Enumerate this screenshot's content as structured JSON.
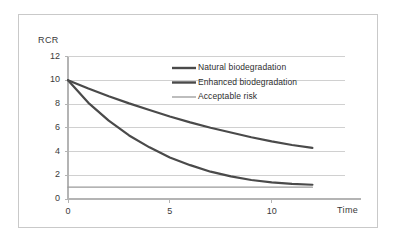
{
  "figure": {
    "background_color": "#ffffff",
    "frame_color": "#c9c9c9"
  },
  "chart_data": {
    "type": "line",
    "title": "",
    "subtitle": "",
    "xlabel": "Time",
    "ylabel": "RCR",
    "xlim": [
      0,
      13.6
    ],
    "ylim": [
      0,
      12
    ],
    "x_ticks": [
      0,
      5,
      10
    ],
    "x_tick_labels": [
      "0",
      "5",
      "10"
    ],
    "y_ticks": [
      0,
      2,
      4,
      6,
      8,
      10,
      12
    ],
    "y_tick_labels": [
      "0",
      "2",
      "4",
      "6",
      "8",
      "10",
      "12"
    ],
    "grid": "horizontal",
    "grid_color": "#d0d0d0",
    "legend_position": "upper-right-inside",
    "series": [
      {
        "name": "Natural biodegradation",
        "color": "#4a4a4a",
        "line_width": 2.2,
        "x": [
          0,
          1,
          2,
          3,
          4,
          5,
          6,
          7,
          8,
          9,
          10,
          11,
          12
        ],
        "values": [
          10.0,
          9.3,
          8.65,
          8.05,
          7.5,
          6.95,
          6.45,
          6.0,
          5.6,
          5.2,
          4.85,
          4.55,
          4.3
        ]
      },
      {
        "name": "Enhanced biodegradation",
        "color": "#4a4a4a",
        "line_width": 2.2,
        "x": [
          0,
          1,
          2,
          3,
          4,
          5,
          6,
          7,
          8,
          9,
          10,
          11,
          12
        ],
        "values": [
          10.0,
          8.1,
          6.6,
          5.35,
          4.35,
          3.5,
          2.85,
          2.3,
          1.9,
          1.6,
          1.4,
          1.28,
          1.2
        ]
      },
      {
        "name": "Acceptable risk",
        "color": "#9a9a9a",
        "line_width": 1.3,
        "x": [
          0,
          12
        ],
        "values": [
          1.0,
          1.0
        ]
      }
    ]
  },
  "legend": {
    "entries": [
      {
        "label": "Natural biodegradation",
        "color": "#4a4a4a",
        "line_width": 2.4
      },
      {
        "label": "Enhanced biodegradation",
        "color": "#4a4a4a",
        "line_width": 2.4
      },
      {
        "label": "Acceptable risk",
        "color": "#9a9a9a",
        "line_width": 1.3
      }
    ]
  }
}
